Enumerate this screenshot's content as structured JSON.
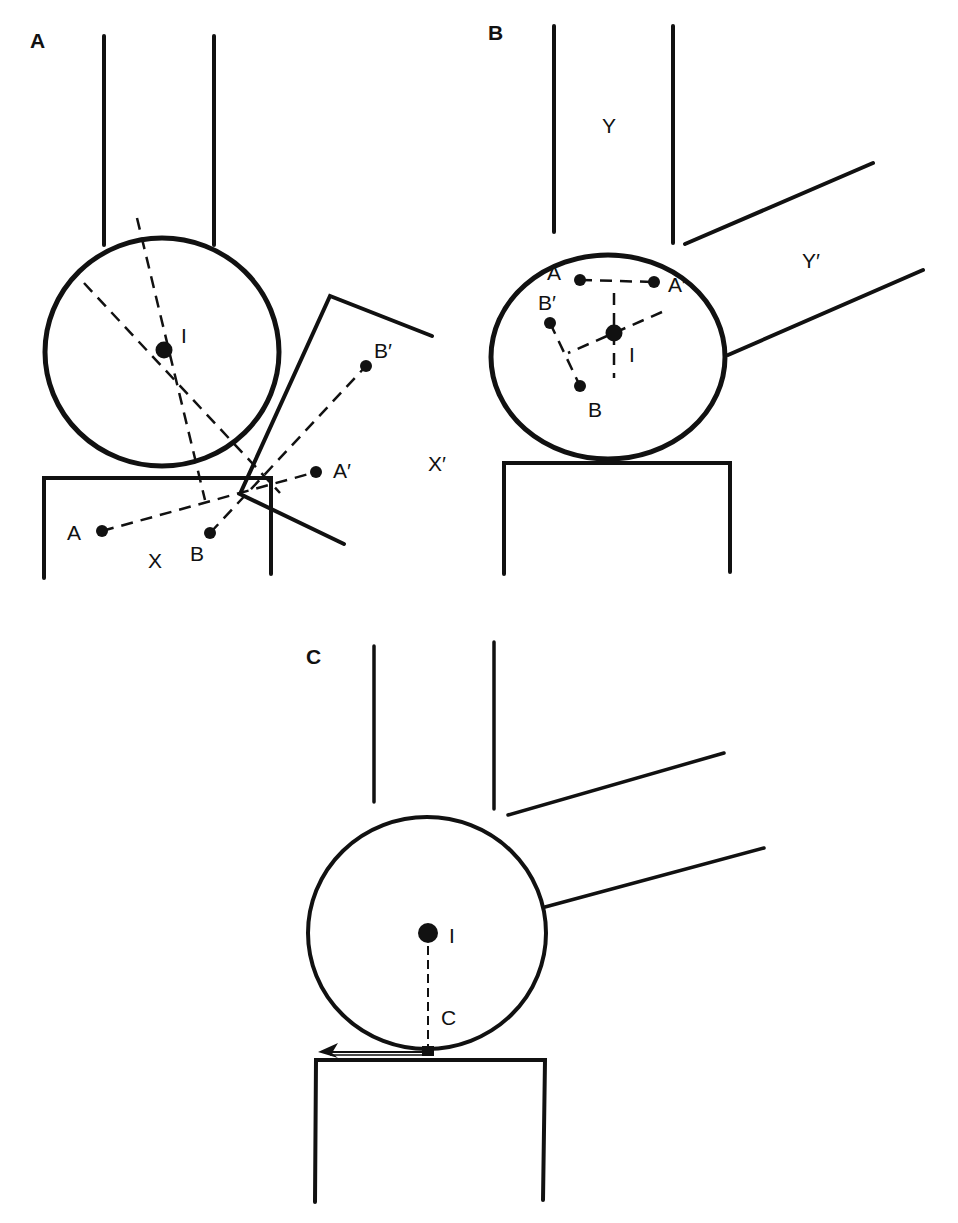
{
  "figure": {
    "panels": [
      {
        "id": "A",
        "label": "A",
        "points": {
          "center": "I",
          "a": "A",
          "b": "B",
          "a_prime": "A′",
          "b_prime": "B′"
        },
        "segments": {
          "fixed": "X",
          "moved": "X′"
        }
      },
      {
        "id": "B",
        "label": "B",
        "points": {
          "center": "I",
          "a": "A",
          "b": "B",
          "a_prime": "A′",
          "b_prime": "B′"
        },
        "segments": {
          "fixed": "Y",
          "moved": "Y′"
        }
      },
      {
        "id": "C",
        "label": "C",
        "points": {
          "center": "I",
          "contact": "C"
        }
      }
    ],
    "colors": {
      "ink": "#111111",
      "background": "#ffffff"
    }
  }
}
